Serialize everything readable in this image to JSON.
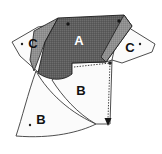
{
  "diagram": {
    "background_color": "#ffffff",
    "panels": [
      {
        "id": "panel-a",
        "label": "A",
        "fill": "#5e5e5e",
        "label_color": "#ffffff",
        "texture": "dotted-screen",
        "shaded": true
      },
      {
        "id": "panel-a-side",
        "label": "",
        "fill": "#8f8f8f",
        "label_color": "#ffffff",
        "texture": "flat",
        "shaded": true
      },
      {
        "id": "panel-c-left",
        "label": "C",
        "fill": "#fbfbfb",
        "label_color": "#111111",
        "texture": "none",
        "shaded": false
      },
      {
        "id": "panel-c-right",
        "label": "C",
        "fill": "#fbfbfb",
        "label_color": "#111111",
        "texture": "none",
        "shaded": false
      },
      {
        "id": "panel-b-center",
        "label": "B",
        "fill": "#fbfbfb",
        "label_color": "#111111",
        "texture": "none",
        "shaded": false
      },
      {
        "id": "panel-b-lower-left",
        "label": "B",
        "fill": "#fafafa",
        "label_color": "#111111",
        "texture": "none",
        "shaded": false
      }
    ],
    "markers": {
      "corner_dot_count": 5,
      "arrow_count": 1,
      "dotted_guide_count": 2
    },
    "stroke_color": "#3a3a3a",
    "dark_fill": "#5e5e5e",
    "mid_fill": "#8f8f8f",
    "light_fill": "#fbfbfb"
  }
}
